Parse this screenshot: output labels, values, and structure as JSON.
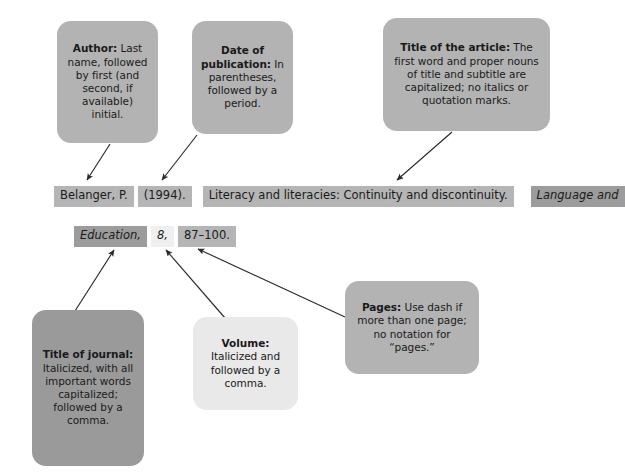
{
  "diagram": {
    "kind": "apa-journal-article-citation-breakdown",
    "callouts": [
      {
        "name": "author",
        "title": "Author:",
        "body": " Last name, followed by first (and second, if available) initial.",
        "shade": "#b3b3b3",
        "points_to": "Belanger, P."
      },
      {
        "name": "date-of-publication",
        "title": "Date of publication:",
        "body": " In parentheses, followed by a period.",
        "shade": "#b3b3b3",
        "points_to": "(1994)."
      },
      {
        "name": "title-of-the-article",
        "title": "Title of the article:",
        "body": " The first word and proper nouns of title and subtitle are capitalized; no italics or quotation marks.",
        "shade": "#b3b3b3",
        "points_to": "Literacy and literacies: Continuity and discontinuity."
      },
      {
        "name": "title-of-journal",
        "title": "Title of journal:",
        "body": " Italicized, with all important words capitalized; followed by a comma.",
        "shade": "#9a9a9a",
        "points_to": "Education,"
      },
      {
        "name": "volume",
        "title": "Volume:",
        "body": " Italicized and followed by a comma.",
        "shade": "#e9e9e9",
        "points_to": "8,"
      },
      {
        "name": "pages",
        "title": "Pages:",
        "body": " Use dash if more than one page; no notation for “pages.”",
        "shade": "#b3b3b3",
        "points_to": "87–100."
      }
    ],
    "citation": {
      "line1": [
        {
          "name": "author-chunk",
          "text": "Belanger, P.",
          "style": "normal",
          "highlight": "#b5b5b5"
        },
        {
          "name": "date-chunk",
          "text": "(1994).",
          "style": "normal",
          "highlight": "#b5b5b5"
        },
        {
          "name": "article-title-chunk",
          "text": "Literacy and literacies: Continuity and discontinuity.",
          "style": "normal",
          "highlight": "#b5b5b5"
        },
        {
          "name": "journal-title-chunk-a",
          "text": "Language and",
          "style": "italic",
          "highlight": "#9c9c9c"
        }
      ],
      "line2": [
        {
          "name": "journal-title-chunk-b",
          "text": "Education,",
          "style": "italic",
          "highlight": "#9c9c9c"
        },
        {
          "name": "volume-chunk",
          "text": "8,",
          "style": "italic",
          "highlight": "#efefef"
        },
        {
          "name": "pages-chunk",
          "text": "87–100.",
          "style": "normal",
          "highlight": "#b5b5b5"
        }
      ]
    },
    "arrows": [
      {
        "name": "arrow-author-to-citation",
        "from": "author-box",
        "to": "author-chunk"
      },
      {
        "name": "arrow-date-to-citation",
        "from": "date-box",
        "to": "date-chunk"
      },
      {
        "name": "arrow-article-title-to-citation",
        "from": "title-box",
        "to": "article-title-chunk"
      },
      {
        "name": "arrow-journal-to-citation",
        "from": "journal-box",
        "to": "journal-title-chunk-b"
      },
      {
        "name": "arrow-volume-to-citation",
        "from": "volume-box",
        "to": "volume-chunk"
      },
      {
        "name": "arrow-pages-to-citation",
        "from": "pages-box",
        "to": "pages-chunk"
      }
    ],
    "colors": {
      "background": "#ffffff",
      "arrow": "#2b2b2b",
      "text": "#1a1a1a"
    }
  }
}
